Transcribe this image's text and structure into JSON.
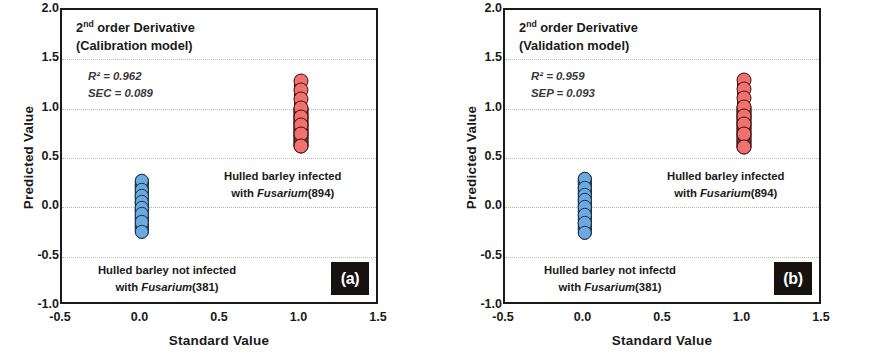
{
  "figure": {
    "panels": [
      {
        "id": "a",
        "badge": "(a)",
        "title_prefix": "2",
        "title_sup": "nd",
        "title_rest": " order Derivative",
        "title_line2": "(Calibration model)",
        "stat1": "R² = 0.962",
        "stat2": "SEC = 0.089",
        "annotation_infected_line1": "Hulled barley infected",
        "annotation_infected_line2_pre": "with ",
        "annotation_infected_species": "Fusarium",
        "annotation_infected_line2_post": "(894)",
        "annotation_clean_line1": "Hulled barley not infected",
        "annotation_clean_line2_pre": "with ",
        "annotation_clean_species": "Fusarium",
        "annotation_clean_line2_post": "(381)"
      },
      {
        "id": "b",
        "badge": "(b)",
        "title_prefix": "2",
        "title_sup": "nd",
        "title_rest": " order Derivative",
        "title_line2": "(Validation model)",
        "stat1": "R² = 0.959",
        "stat2": "SEP = 0.093",
        "annotation_infected_line1": "Hulled barley infected",
        "annotation_infected_line2_pre": "with ",
        "annotation_infected_species": "Fusarium",
        "annotation_infected_line2_post": "(894)",
        "annotation_clean_line1": "Hulled barley not infectd",
        "annotation_clean_line2_pre": "with ",
        "annotation_clean_species": "Fusarium",
        "annotation_clean_line2_post": "(381)"
      }
    ],
    "axis": {
      "xlabel": "Standard Value",
      "ylabel": "Predicted Value",
      "xticks": [
        "-0.5",
        "0.0",
        "0.5",
        "1.0",
        "1.5"
      ],
      "yticks": [
        "2.0",
        "1.5",
        "1.0",
        "0.5",
        "0.0",
        "-0.5",
        "-1.0"
      ]
    }
  },
  "chart_data": [
    {
      "type": "scatter",
      "panel": "a",
      "title": "2nd order Derivative (Calibration model)",
      "xlabel": "Standard Value",
      "ylabel": "Predicted Value",
      "xlim": [
        -0.5,
        1.5
      ],
      "ylim": [
        -1.0,
        2.0
      ],
      "xticks": [
        -0.5,
        0.0,
        0.5,
        1.0,
        1.5
      ],
      "yticks": [
        -1.0,
        -0.5,
        0.0,
        0.5,
        1.0,
        1.5,
        2.0
      ],
      "grid": "horizontal-dotted",
      "legend": "none",
      "statistics": {
        "R2": 0.962,
        "SEC": 0.089
      },
      "series": [
        {
          "name": "Hulled barley not infected with Fusarium (381)",
          "color": "#6aa9e2",
          "n": 381,
          "x_value": 0.0,
          "y_min": -0.25,
          "y_max": 0.27,
          "y_values": [
            0.27,
            0.24,
            0.21,
            0.18,
            0.15,
            0.13,
            0.11,
            0.09,
            0.07,
            0.05,
            0.03,
            0.01,
            -0.01,
            -0.03,
            -0.05,
            -0.07,
            -0.09,
            -0.12,
            -0.15,
            -0.18,
            -0.21,
            -0.25
          ]
        },
        {
          "name": "Hulled barley infected with Fusarium (894)",
          "color": "#f2706e",
          "n": 894,
          "x_value": 1.0,
          "y_min": 0.62,
          "y_max": 1.28,
          "y_values": [
            1.28,
            1.25,
            1.22,
            1.19,
            1.16,
            1.13,
            1.1,
            1.07,
            1.04,
            1.01,
            0.98,
            0.95,
            0.92,
            0.89,
            0.86,
            0.83,
            0.8,
            0.77,
            0.74,
            0.71,
            0.67,
            0.62
          ]
        }
      ]
    },
    {
      "type": "scatter",
      "panel": "b",
      "title": "2nd order Derivative (Validation model)",
      "xlabel": "Standard Value",
      "ylabel": "Predicted Value",
      "xlim": [
        -0.5,
        1.5
      ],
      "ylim": [
        -1.0,
        2.0
      ],
      "xticks": [
        -0.5,
        0.0,
        0.5,
        1.0,
        1.5
      ],
      "yticks": [
        -1.0,
        -0.5,
        0.0,
        0.5,
        1.0,
        1.5,
        2.0
      ],
      "grid": "horizontal-dotted",
      "legend": "none",
      "statistics": {
        "R2": 0.959,
        "SEP": 0.093
      },
      "series": [
        {
          "name": "Hulled barley not infectd with Fusarium (381)",
          "color": "#6aa9e2",
          "n": 381,
          "x_value": 0.0,
          "y_min": -0.26,
          "y_max": 0.29,
          "y_values": [
            0.29,
            0.26,
            0.23,
            0.2,
            0.17,
            0.15,
            0.13,
            0.11,
            0.09,
            0.07,
            0.05,
            0.02,
            0.0,
            -0.03,
            -0.05,
            -0.08,
            -0.1,
            -0.13,
            -0.16,
            -0.19,
            -0.22,
            -0.26
          ]
        },
        {
          "name": "Hulled barley infected with Fusarium (894)",
          "color": "#f2706e",
          "n": 894,
          "x_value": 1.0,
          "y_min": 0.61,
          "y_max": 1.29,
          "y_values": [
            1.29,
            1.26,
            1.23,
            1.2,
            1.17,
            1.14,
            1.11,
            1.08,
            1.05,
            1.02,
            0.99,
            0.96,
            0.93,
            0.9,
            0.87,
            0.84,
            0.81,
            0.77,
            0.74,
            0.7,
            0.66,
            0.61
          ]
        }
      ]
    }
  ]
}
